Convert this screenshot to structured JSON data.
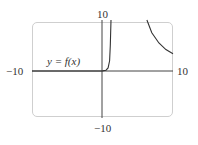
{
  "chart_data": {
    "type": "line",
    "title": "",
    "xlabel": "",
    "ylabel": "",
    "xlim": [
      -10,
      10
    ],
    "ylim": [
      -10,
      10
    ],
    "grid": false,
    "tick_labels": {
      "x_min": "−10",
      "x_max": "10",
      "y_min": "−10",
      "y_max": "10"
    },
    "annotations": [
      {
        "text": "y = f(x)",
        "x": -7,
        "y": 1
      }
    ],
    "series": [
      {
        "name": "y = f(x)",
        "branch": 1,
        "points": [
          [
            -10,
            0
          ],
          [
            -5,
            0
          ],
          [
            0,
            0.02
          ],
          [
            0.5,
            0.15
          ],
          [
            0.8,
            0.6
          ],
          [
            1.0,
            2
          ],
          [
            1.1,
            5
          ],
          [
            1.2,
            10
          ]
        ]
      },
      {
        "name": "y = f(x)",
        "branch": 2,
        "points": [
          [
            6.3,
            10
          ],
          [
            7,
            7.5
          ],
          [
            8,
            5.5
          ],
          [
            9,
            4.2
          ],
          [
            10,
            3.4
          ]
        ]
      }
    ]
  }
}
